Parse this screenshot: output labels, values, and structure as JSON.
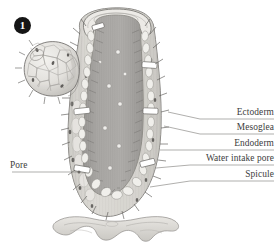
{
  "figure": {
    "marker": {
      "number": "1",
      "icon": "filled-circle-number-marker"
    },
    "background_color": "#ffffff",
    "ink_color": "#3d3d3d",
    "body_fill": "#d8d6d2",
    "cavity_fill": "#a9a7a4",
    "wall_fill": "#efeeea",
    "shadow_fill": "#bfbdb9"
  },
  "labels": {
    "right": [
      {
        "id": "ectoderm",
        "text": "Ectoderm",
        "line_y": 119,
        "anchor_x": 168,
        "anchor_y": 112
      },
      {
        "id": "mesoglea",
        "text": "Mesoglea",
        "line_y": 134,
        "anchor_x": 164,
        "anchor_y": 126
      },
      {
        "id": "endoderm",
        "text": "Endoderm",
        "line_y": 150,
        "anchor_x": 160,
        "anchor_y": 150
      },
      {
        "id": "water-intake-pore",
        "text": "Water intake pore",
        "line_y": 165,
        "anchor_x": 156,
        "anchor_y": 168
      },
      {
        "id": "spicule",
        "text": "Spicule",
        "line_y": 181,
        "anchor_x": 150,
        "anchor_y": 186
      }
    ],
    "left": [
      {
        "id": "pore",
        "text": "Pore",
        "line_y": 172,
        "anchor_x": 79,
        "anchor_y": 172
      }
    ]
  },
  "anatomy": {
    "parts": [
      "osculum",
      "spongocoel",
      "bud",
      "holdfast-base",
      "choanocyte-lining",
      "spicules",
      "ostia"
    ]
  }
}
